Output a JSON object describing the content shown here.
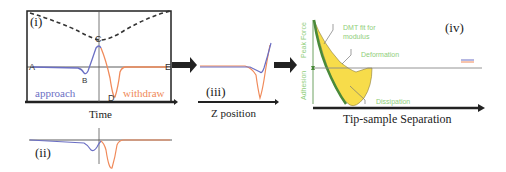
{
  "panels": {
    "i": {
      "label": "(i)",
      "points": {
        "A": "A",
        "B": "B",
        "C": "C",
        "D": "D",
        "E": "E"
      },
      "approach_label": "approach",
      "withdraw_label": "withdraw",
      "xaxis_label": "Time"
    },
    "ii": {
      "label": "(ii)"
    },
    "iii": {
      "label": "(iii)",
      "xaxis_label": "Z position"
    },
    "iv": {
      "label": "(iv)",
      "xaxis_label": "Tip-sample Separation",
      "annotations": {
        "dmt_line1": "DMT fit for",
        "dmt_line2": "modulus",
        "deformation": "Deformation",
        "dissipation": "Dissipation",
        "peak_force": "Peak Force",
        "adhesion": "Adhesion"
      }
    }
  },
  "colors": {
    "approach": "#6b6fc4",
    "withdraw": "#f08a5a",
    "annotation_green": "#8fce7a",
    "dark_green": "#4a8a3a",
    "fill_yellow": "#f7dc4a",
    "axis": "#222222"
  }
}
